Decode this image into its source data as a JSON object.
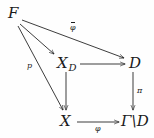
{
  "diagram": {
    "type": "commutative-diagram",
    "width": 154,
    "height": 138,
    "background_color": "#fefefe",
    "ink_color": "#1a1a1a",
    "nodes": [
      {
        "id": "F",
        "label": "F",
        "base": "F",
        "sub": "",
        "x": 10,
        "y": 12
      },
      {
        "id": "XD",
        "label": "X_D",
        "base": "X",
        "sub": "D",
        "x": 58,
        "y": 58
      },
      {
        "id": "D",
        "label": "D",
        "base": "D",
        "sub": "",
        "x": 130,
        "y": 58
      },
      {
        "id": "X",
        "label": "X",
        "base": "X",
        "sub": "",
        "x": 60,
        "y": 116
      },
      {
        "id": "GammaD",
        "label": "Gamma\\D",
        "base": "Γ\\D",
        "sub": "",
        "x": 122,
        "y": 116
      }
    ],
    "edges": [
      {
        "id": "F-to-XD",
        "from": "F",
        "to": "XD",
        "label": ""
      },
      {
        "id": "F-to-D",
        "from": "F",
        "to": "D",
        "label": "φ",
        "label_overbar": true
      },
      {
        "id": "F-to-X",
        "from": "F",
        "to": "X",
        "label": "p"
      },
      {
        "id": "XD-to-D",
        "from": "XD",
        "to": "D",
        "label": ""
      },
      {
        "id": "XD-to-X",
        "from": "XD",
        "to": "X",
        "label": ""
      },
      {
        "id": "D-to-GammaD",
        "from": "D",
        "to": "GammaD",
        "label": "π"
      },
      {
        "id": "X-to-GammaD",
        "from": "X",
        "to": "GammaD",
        "label": "φ"
      }
    ],
    "labels": {
      "phi_bar": "φ",
      "p": "p",
      "pi": "π",
      "phi": "φ"
    }
  }
}
